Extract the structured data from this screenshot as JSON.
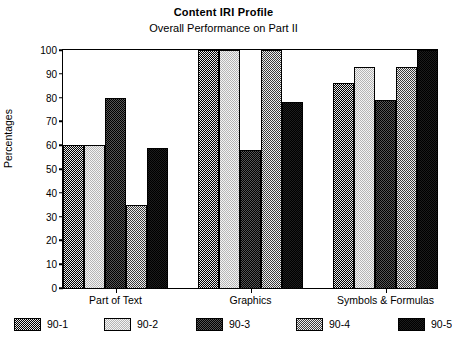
{
  "chart_data": {
    "type": "bar",
    "title": "Content IRI Profile",
    "subtitle": "Overall Performance on Part II",
    "xlabel": "",
    "ylabel": "Percentages",
    "ylim": [
      0,
      100
    ],
    "yticks": [
      0,
      10,
      20,
      30,
      40,
      50,
      60,
      70,
      80,
      90,
      100
    ],
    "grid": false,
    "legend_position": "bottom",
    "categories": [
      "Part of Text",
      "Graphics",
      "Symbols & Formulas"
    ],
    "series": [
      {
        "name": "90-1",
        "values": [
          60,
          100,
          86
        ],
        "color": "#7d7d7d",
        "pattern": "dense-dot-dark"
      },
      {
        "name": "90-2",
        "values": [
          60,
          100,
          93
        ],
        "color": "#e2e2e2",
        "pattern": "light-dot"
      },
      {
        "name": "90-3",
        "values": [
          80,
          58,
          79
        ],
        "color": "#2a2a2a",
        "pattern": "very-dark-dot"
      },
      {
        "name": "90-4",
        "values": [
          35,
          100,
          93
        ],
        "color": "#a8a8a8",
        "pattern": "medium-dot"
      },
      {
        "name": "90-5",
        "values": [
          59,
          78,
          100
        ],
        "color": "#0a0a0a",
        "pattern": "solid-black"
      }
    ]
  },
  "legend": {
    "items": [
      {
        "label": "90-1"
      },
      {
        "label": "90-2"
      },
      {
        "label": "90-3"
      },
      {
        "label": "90-4"
      },
      {
        "label": "90-5"
      }
    ]
  }
}
